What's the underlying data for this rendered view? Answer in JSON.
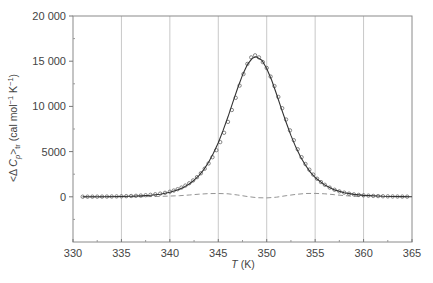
{
  "chart_data": {
    "type": "line",
    "title": "",
    "xlabel": "T (K)",
    "xlabel_parts": {
      "italic": "T",
      "rest": " (K)"
    },
    "ylabel": "<Δ Cp>tr (cal mol⁻¹ K⁻¹)",
    "ylabel_parts": {
      "pre": "<Δ ",
      "italic": "C",
      "sub_p": "p",
      "mid": ">",
      "sub_tr": "tr",
      "post": " (cal mol",
      "sup1": "−1",
      "k": " K",
      "sup2": "−1",
      "close": ")"
    },
    "xlim": [
      330,
      365
    ],
    "ylim": [
      -5000,
      20000
    ],
    "x_ticks": [
      330,
      335,
      340,
      345,
      350,
      355,
      360,
      365
    ],
    "x_tick_labels": [
      "330",
      "335",
      "340",
      "345",
      "350",
      "355",
      "360",
      "365"
    ],
    "y_ticks": [
      0,
      5000,
      10000,
      15000,
      20000
    ],
    "y_tick_labels": [
      "0",
      "5000",
      "10 000",
      "15 000",
      "20 000"
    ],
    "grid": {
      "vertical": true,
      "horizontal": false
    },
    "legend": null,
    "series": [
      {
        "name": "experimental",
        "style": "open-circles",
        "x": [
          331,
          331.5,
          332,
          332.5,
          333,
          333.5,
          334,
          334.5,
          335,
          335.5,
          336,
          336.5,
          337,
          337.5,
          338,
          338.5,
          339,
          339.5,
          340,
          340.4,
          340.8,
          341.2,
          341.6,
          342,
          342.4,
          342.8,
          343.2,
          343.6,
          344,
          344.4,
          344.8,
          345.2,
          345.6,
          346,
          346.4,
          346.8,
          347.2,
          347.6,
          348,
          348.4,
          348.8,
          349.2,
          349.6,
          350,
          350.4,
          350.8,
          351.2,
          351.6,
          352,
          352.4,
          352.8,
          353.2,
          353.6,
          354,
          354.4,
          354.8,
          355.2,
          355.6,
          356,
          356.5,
          357,
          357.5,
          358,
          358.5,
          359,
          359.5,
          360,
          360.5,
          361,
          361.5,
          362,
          362.5,
          363,
          363.5,
          364,
          364.5
        ],
        "y": [
          10,
          12,
          15,
          18,
          22,
          28,
          35,
          45,
          55,
          70,
          88,
          110,
          140,
          175,
          220,
          280,
          350,
          440,
          560,
          690,
          840,
          1020,
          1240,
          1500,
          1810,
          2170,
          2600,
          3110,
          3690,
          4380,
          5160,
          6050,
          7080,
          8290,
          9600,
          10950,
          12300,
          13580,
          14700,
          15420,
          15650,
          15420,
          14900,
          14250,
          13300,
          12250,
          11050,
          9800,
          8550,
          7350,
          6260,
          5260,
          4380,
          3630,
          3000,
          2460,
          2000,
          1630,
          1330,
          1020,
          780,
          600,
          460,
          350,
          270,
          210,
          165,
          130,
          100,
          80,
          60,
          48,
          38,
          30,
          24,
          18
        ]
      },
      {
        "name": "fit",
        "style": "solid-line",
        "x": [
          331,
          333,
          335,
          336,
          337,
          338,
          339,
          340,
          341,
          341.5,
          342,
          342.5,
          343,
          343.5,
          344,
          344.5,
          345,
          345.5,
          346,
          346.5,
          347,
          347.5,
          348,
          348.5,
          348.9,
          349.5,
          350,
          350.5,
          351,
          351.5,
          352,
          352.5,
          353,
          353.5,
          354,
          354.5,
          355,
          356,
          357,
          358,
          359,
          360,
          362,
          364,
          365
        ],
        "y": [
          4,
          12,
          34,
          58,
          100,
          171,
          291,
          497,
          845,
          1100,
          1420,
          1840,
          2350,
          3010,
          3830,
          4810,
          5990,
          7340,
          8850,
          10440,
          12030,
          13460,
          14610,
          15320,
          15500,
          15100,
          14190,
          12920,
          11390,
          9800,
          8240,
          6790,
          5500,
          4400,
          3480,
          2730,
          2130,
          1290,
          765,
          450,
          262,
          153,
          52,
          18,
          10
        ]
      },
      {
        "name": "residual",
        "style": "dashed-line",
        "x": [
          331,
          334,
          337,
          339,
          341,
          342,
          343,
          344,
          345,
          346,
          347,
          348,
          349,
          350,
          351,
          352,
          353,
          354,
          355,
          356,
          357,
          358,
          359,
          360
        ],
        "y": [
          0,
          0,
          10,
          40,
          120,
          200,
          290,
          350,
          370,
          330,
          200,
          30,
          -100,
          -120,
          -40,
          120,
          270,
          360,
          380,
          330,
          230,
          130,
          60,
          20
        ]
      }
    ]
  }
}
